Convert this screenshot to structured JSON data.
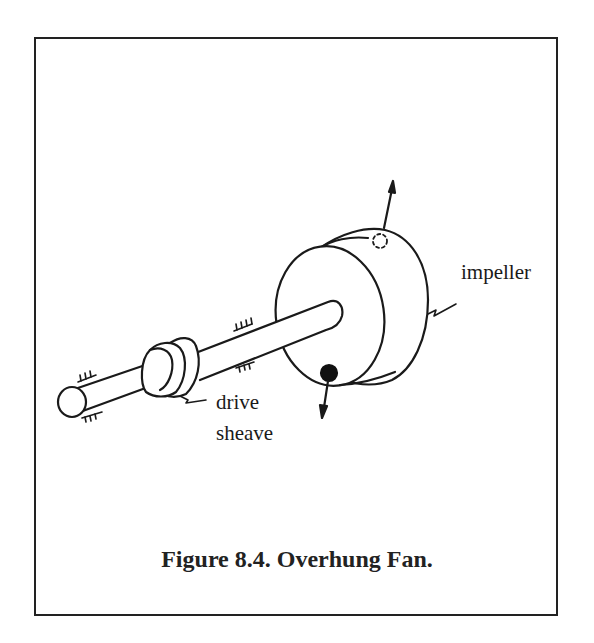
{
  "figure": {
    "caption": "Figure 8.4. Overhung Fan.",
    "labels": {
      "impeller": "impeller",
      "drive_line1": "drive",
      "drive_line2": "sheave"
    },
    "components": [
      "shaft",
      "drive-sheave",
      "impeller",
      "unbalance-mass",
      "force-arrows",
      "bearing-supports"
    ],
    "colors": {
      "line": "#1a1a1a",
      "background": "#ffffff"
    }
  }
}
